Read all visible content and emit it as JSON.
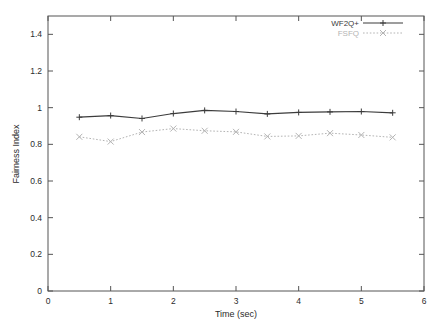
{
  "chart_data": {
    "type": "line",
    "title": "",
    "xlabel": "Time (sec)",
    "ylabel": "Fairness Index",
    "xlim": [
      0,
      6
    ],
    "ylim": [
      0,
      1.5
    ],
    "xticks": [
      "0",
      "1",
      "2",
      "3",
      "4",
      "5",
      "6"
    ],
    "xtick_values": [
      0,
      1,
      2,
      3,
      4,
      5,
      6
    ],
    "yticks": [
      "0",
      "0.2",
      "0.4",
      "0.6",
      "0.8",
      "1",
      "1.2",
      "1.4"
    ],
    "ytick_values": [
      0,
      0.2,
      0.4,
      0.6,
      0.8,
      1,
      1.2,
      1.4
    ],
    "grid": false,
    "legend_position": "top-right",
    "x": [
      0.5,
      1.0,
      1.5,
      2.0,
      2.5,
      3.0,
      3.5,
      4.0,
      4.5,
      5.0,
      5.5
    ],
    "series": [
      {
        "name": "WF2Q+",
        "color": "#3c3c3c",
        "linestyle": "solid",
        "marker": "plus",
        "values": [
          0.948,
          0.957,
          0.941,
          0.968,
          0.985,
          0.979,
          0.966,
          0.974,
          0.977,
          0.979,
          0.972
        ]
      },
      {
        "name": "FSFQ",
        "color": "#b4b4b4",
        "linestyle": "dotted",
        "marker": "cross",
        "values": [
          0.841,
          0.815,
          0.867,
          0.886,
          0.874,
          0.868,
          0.843,
          0.846,
          0.861,
          0.851,
          0.838
        ]
      }
    ]
  },
  "legend": {
    "entries": [
      {
        "label": "WF2Q+"
      },
      {
        "label": "FSFQ"
      }
    ]
  },
  "axes": {
    "x_title": "Time (sec)",
    "y_title": "Fairness Index"
  }
}
